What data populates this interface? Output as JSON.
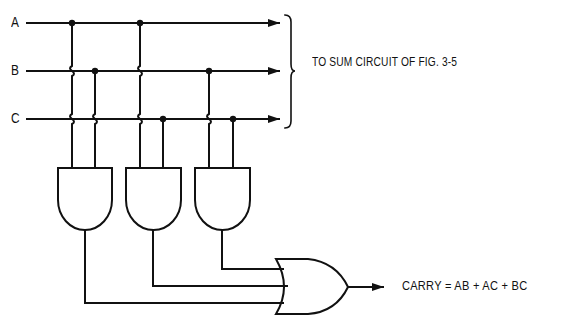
{
  "diagram": {
    "inputs": [
      {
        "label": "A",
        "y": 23
      },
      {
        "label": "B",
        "y": 71
      },
      {
        "label": "C",
        "y": 119
      }
    ],
    "bus_destination_note": "TO SUM CIRCUIT OF FIG. 3-5",
    "and_gates": [
      {
        "name": "AND1",
        "inputs": [
          "A",
          "B"
        ],
        "product": "AB"
      },
      {
        "name": "AND2",
        "inputs": [
          "A",
          "C"
        ],
        "product": "AC"
      },
      {
        "name": "AND3",
        "inputs": [
          "B",
          "C"
        ],
        "product": "BC"
      }
    ],
    "or_gate": {
      "name": "OR1",
      "inputs": [
        "AB",
        "AC",
        "BC"
      ]
    },
    "output_equation": "CARRY = AB + AC + BC",
    "colors": {
      "line": "#111111",
      "background": "#ffffff"
    }
  }
}
